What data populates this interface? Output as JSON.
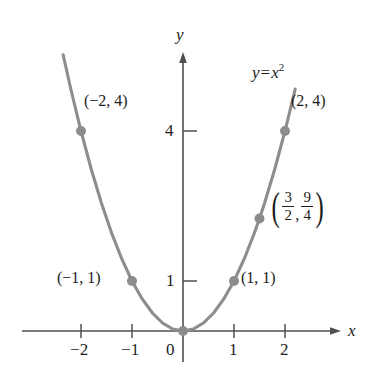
{
  "chart_data": {
    "type": "line",
    "title": "",
    "subtitle": "",
    "equation_label": "y = x",
    "equation_exponent": "2",
    "function": "y = x^2",
    "xlabel": "x",
    "ylabel": "y",
    "xlim": [
      -2.6,
      2.6
    ],
    "ylim": [
      -0.55,
      5.0
    ],
    "grid": false,
    "legend": "none",
    "curve_color": "#8a8a8a",
    "point_color": "#8c8c8c",
    "axis_color": "#4a4a4a",
    "x_ticks": [
      {
        "value": -2,
        "label": "−2"
      },
      {
        "value": -1,
        "label": "−1"
      },
      {
        "value": 0,
        "label": "0"
      },
      {
        "value": 1,
        "label": "1"
      },
      {
        "value": 2,
        "label": "2"
      }
    ],
    "y_ticks": [
      {
        "value": 1,
        "label": "1"
      },
      {
        "value": 4,
        "label": "4"
      }
    ],
    "x": [
      -2.35,
      -2.2,
      -2.0,
      -1.8,
      -1.6,
      -1.4,
      -1.2,
      -1.0,
      -0.8,
      -0.6,
      -0.4,
      -0.2,
      0,
      0.2,
      0.4,
      0.6,
      0.8,
      1.0,
      1.2,
      1.4,
      1.5,
      1.6,
      1.8,
      2.0,
      2.2
    ],
    "y": [
      5.5225,
      4.84,
      4.0,
      3.24,
      2.56,
      1.96,
      1.44,
      1.0,
      0.64,
      0.36,
      0.16,
      0.04,
      0,
      0.04,
      0.16,
      0.36,
      0.64,
      1.0,
      1.44,
      1.96,
      2.25,
      2.56,
      3.24,
      4.0,
      4.84
    ],
    "points": [
      {
        "id": "pt-neg2-4",
        "x": -2,
        "y": 4,
        "label": "(−2, 4)",
        "label_type": "plain",
        "label_side": "right"
      },
      {
        "id": "pt-neg1-1",
        "x": -1,
        "y": 1,
        "label": "(−1, 1)",
        "label_type": "plain",
        "label_side": "left"
      },
      {
        "id": "pt-origin",
        "x": 0,
        "y": 0,
        "label": "",
        "label_type": "none",
        "label_side": "none"
      },
      {
        "id": "pt-1-1",
        "x": 1,
        "y": 1,
        "label": "(1, 1)",
        "label_type": "plain",
        "label_side": "right"
      },
      {
        "id": "pt-3over2",
        "x": 1.5,
        "y": 2.25,
        "label": "(3/2, 9/4)",
        "label_type": "fraction",
        "label_side": "right",
        "num1": "3",
        "den1": "2",
        "num2": "9",
        "den2": "4",
        "comma": ","
      },
      {
        "id": "pt-2-4",
        "x": 2,
        "y": 4,
        "label": "(2, 4)",
        "label_type": "plain",
        "label_side": "right"
      }
    ],
    "annotations": [
      {
        "id": "equation",
        "text": "y = x²",
        "x": 1.6,
        "y": 4.7
      }
    ]
  },
  "labels": {
    "axis_x": "x",
    "axis_y": "y",
    "eq_y": "y",
    "eq_equals": "=",
    "eq_x": "x",
    "eq_exp": "2",
    "tick_xm2": "−2",
    "tick_xm1": "−1",
    "tick_x0": "0",
    "tick_x1": "1",
    "tick_x2": "2",
    "tick_y1": "1",
    "tick_y4": "4",
    "pt_neg2_4": "(−2, 4)",
    "pt_neg1_1": "(−1, 1)",
    "pt_1_1": "(1, 1)",
    "pt_2_4": "(2, 4)",
    "frac_open": "(",
    "frac_close": ")",
    "frac_num1": "3",
    "frac_den1": "2",
    "frac_comma": ",",
    "frac_num2": "9",
    "frac_den2": "4"
  }
}
